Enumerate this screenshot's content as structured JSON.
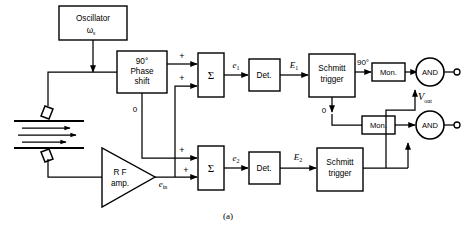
{
  "figure": {
    "caption": "(a)",
    "type": "block-diagram"
  },
  "blocks": {
    "oscillator": {
      "line1": "Oscillator",
      "line2": "ω",
      "sub2": "s"
    },
    "phase_shift": {
      "line1": "90°",
      "line2": "Phase",
      "line3": "shift"
    },
    "rf_amp": {
      "line1": "R F",
      "line2": "amp."
    },
    "summer_top": {
      "label": "Σ"
    },
    "summer_bottom": {
      "label": "Σ"
    },
    "det_top": {
      "label": "Det."
    },
    "det_bottom": {
      "label": "Det."
    },
    "schmitt_top": {
      "line1": "Schmitt",
      "line2": "trigger"
    },
    "schmitt_bottom": {
      "line1": "Schmitt",
      "line2": "trigger"
    },
    "mon_top": {
      "label": "Mon."
    },
    "mon_bottom": {
      "label": "Mon."
    },
    "and_top": {
      "label": "AND"
    },
    "and_bottom": {
      "label": "AND"
    }
  },
  "signals": {
    "e_in": {
      "base": "e",
      "sub": "in"
    },
    "e1": {
      "base": "e",
      "sub": "1"
    },
    "e2": {
      "base": "e",
      "sub": "2"
    },
    "E1": {
      "base": "E",
      "sub": "1"
    },
    "E2": {
      "base": "E",
      "sub": "2"
    },
    "v_out": {
      "base": "V",
      "sub": "out"
    }
  },
  "annotations": {
    "phase_zero_ref": "0",
    "schmitt_out_90": "90°",
    "schmitt_out_0": "0",
    "sum_top_in1": "+",
    "sum_top_in2": "+",
    "sum_bot_in1": "+",
    "sum_bot_in2": "+"
  },
  "colors": {
    "ink": "#000000",
    "paper": "#ffffff"
  }
}
